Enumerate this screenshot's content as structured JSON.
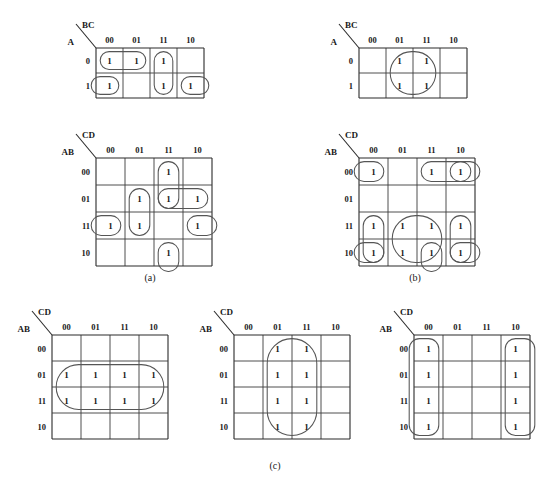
{
  "figure": {
    "captions": {
      "a": "(a)",
      "b": "(b)",
      "c": "(c)"
    },
    "cell_value": "1",
    "col_headers_2": [
      "00",
      "01",
      "11",
      "10"
    ],
    "col_headers_4": [
      "00",
      "01",
      "11",
      "10"
    ],
    "row_headers_2": [
      "0",
      "1"
    ],
    "row_headers_4": [
      "00",
      "01",
      "11",
      "10"
    ],
    "axis_labels": {
      "two_var_col": "BC",
      "two_var_row": "A",
      "four_var_col": "CD",
      "four_var_row": "AB"
    }
  },
  "maps": [
    {
      "id": "a-top",
      "group": "a",
      "vars": 3,
      "col_label": "BC",
      "row_label": "A",
      "col_headers": [
        "00",
        "01",
        "11",
        "10"
      ],
      "row_headers": [
        "0",
        "1"
      ],
      "cells": [
        [
          1,
          1,
          1,
          0
        ],
        [
          1,
          0,
          1,
          1
        ]
      ],
      "loops": [
        {
          "name": "loop-row0-cols00-01",
          "r": 0,
          "c": 0,
          "rows": 1,
          "cols": 2
        },
        {
          "name": "loop-col11-rows0-1",
          "r": 0,
          "c": 2,
          "rows": 2,
          "cols": 1
        },
        {
          "name": "loop-row1-col00",
          "r": 1,
          "c": 0,
          "rows": 1,
          "cols": 1,
          "wrap": "left"
        },
        {
          "name": "loop-row1-col10",
          "r": 1,
          "c": 3,
          "rows": 1,
          "cols": 1,
          "wrap": "right"
        }
      ]
    },
    {
      "id": "a-bottom",
      "group": "a",
      "vars": 4,
      "col_label": "CD",
      "row_label": "AB",
      "col_headers": [
        "00",
        "01",
        "11",
        "10"
      ],
      "row_headers": [
        "00",
        "01",
        "11",
        "10"
      ],
      "cells": [
        [
          0,
          0,
          1,
          0
        ],
        [
          0,
          1,
          1,
          1
        ],
        [
          1,
          1,
          0,
          1
        ],
        [
          0,
          0,
          1,
          0
        ]
      ],
      "loops": [
        {
          "name": "loop-col11-rows00-01",
          "r": 0,
          "c": 2,
          "rows": 2,
          "cols": 1
        },
        {
          "name": "loop-row01-cols11-10",
          "r": 1,
          "c": 2,
          "rows": 1,
          "cols": 2
        },
        {
          "name": "loop-col01-rows01-11",
          "r": 1,
          "c": 1,
          "rows": 2,
          "cols": 1
        },
        {
          "name": "loop-row11-col00",
          "r": 2,
          "c": 0,
          "rows": 1,
          "cols": 1,
          "wrap": "left"
        },
        {
          "name": "loop-row11-col10",
          "r": 2,
          "c": 3,
          "rows": 1,
          "cols": 1,
          "wrap": "right"
        },
        {
          "name": "loop-row10-col11",
          "r": 3,
          "c": 2,
          "rows": 1,
          "cols": 1,
          "wrap": "bottom"
        }
      ]
    },
    {
      "id": "b-top",
      "group": "b",
      "vars": 3,
      "col_label": "BC",
      "row_label": "A",
      "col_headers": [
        "00",
        "01",
        "11",
        "10"
      ],
      "row_headers": [
        "0",
        "1"
      ],
      "cells": [
        [
          0,
          1,
          1,
          0
        ],
        [
          0,
          1,
          1,
          0
        ]
      ],
      "loops": [
        {
          "name": "loop-cols01-11-rows0-1",
          "r": 0,
          "c": 1,
          "rows": 2,
          "cols": 2
        }
      ]
    },
    {
      "id": "b-bottom",
      "group": "b",
      "vars": 4,
      "col_label": "CD",
      "row_label": "AB",
      "col_headers": [
        "00",
        "01",
        "11",
        "10"
      ],
      "row_headers": [
        "00",
        "01",
        "11",
        "10"
      ],
      "cells": [
        [
          1,
          0,
          1,
          1
        ],
        [
          0,
          0,
          0,
          0
        ],
        [
          1,
          1,
          1,
          1
        ],
        [
          1,
          1,
          1,
          1
        ]
      ],
      "loops": [
        {
          "name": "loop-corner-row00-col00",
          "r": 0,
          "c": 0,
          "rows": 1,
          "cols": 1,
          "wrap": "left"
        },
        {
          "name": "loop-row00-cols11-10",
          "r": 0,
          "c": 2,
          "rows": 1,
          "cols": 2
        },
        {
          "name": "loop-corner-row00-col10",
          "r": 0,
          "c": 3,
          "rows": 1,
          "cols": 1,
          "wrap": "right"
        },
        {
          "name": "loop-rows11-10-col00",
          "r": 2,
          "c": 0,
          "rows": 2,
          "cols": 1
        },
        {
          "name": "loop-rows11-10-cols01-11",
          "r": 2,
          "c": 1,
          "rows": 2,
          "cols": 2
        },
        {
          "name": "loop-rows11-10-col10",
          "r": 2,
          "c": 3,
          "rows": 2,
          "cols": 1
        },
        {
          "name": "loop-row10-col00",
          "r": 3,
          "c": 0,
          "rows": 1,
          "cols": 1,
          "wrap": "left"
        },
        {
          "name": "loop-row10-col11",
          "r": 3,
          "c": 2,
          "rows": 1,
          "cols": 1,
          "wrap": "bottom"
        },
        {
          "name": "loop-row10-col10",
          "r": 3,
          "c": 3,
          "rows": 1,
          "cols": 1,
          "wrap": "right"
        }
      ]
    },
    {
      "id": "c-left",
      "group": "c",
      "vars": 4,
      "col_label": "CD",
      "row_label": "AB",
      "col_headers": [
        "00",
        "01",
        "11",
        "10"
      ],
      "row_headers": [
        "00",
        "01",
        "11",
        "10"
      ],
      "cells": [
        [
          0,
          0,
          0,
          0
        ],
        [
          1,
          1,
          1,
          1
        ],
        [
          1,
          1,
          1,
          1
        ],
        [
          0,
          0,
          0,
          0
        ]
      ],
      "loops": [
        {
          "name": "loop-rows01-11-allcols",
          "r": 1,
          "c": 0,
          "rows": 2,
          "cols": 4
        }
      ]
    },
    {
      "id": "c-middle",
      "group": "c",
      "vars": 4,
      "col_label": "CD",
      "row_label": "AB",
      "col_headers": [
        "00",
        "01",
        "11",
        "10"
      ],
      "row_headers": [
        "00",
        "01",
        "11",
        "10"
      ],
      "cells": [
        [
          0,
          1,
          1,
          0
        ],
        [
          0,
          1,
          1,
          0
        ],
        [
          0,
          1,
          1,
          0
        ],
        [
          0,
          1,
          1,
          0
        ]
      ],
      "loops": [
        {
          "name": "loop-cols01-11-allrows",
          "r": 0,
          "c": 1,
          "rows": 4,
          "cols": 2
        }
      ]
    },
    {
      "id": "c-right",
      "group": "c",
      "vars": 4,
      "col_label": "CD",
      "row_label": "AB",
      "col_headers": [
        "00",
        "01",
        "11",
        "10"
      ],
      "row_headers": [
        "00",
        "01",
        "11",
        "10"
      ],
      "cells": [
        [
          1,
          0,
          0,
          1
        ],
        [
          1,
          0,
          0,
          1
        ],
        [
          1,
          0,
          0,
          1
        ],
        [
          1,
          0,
          0,
          1
        ]
      ],
      "loops": [
        {
          "name": "loop-col00-allrows",
          "r": 0,
          "c": 0,
          "rows": 4,
          "cols": 1,
          "wrap": "left"
        },
        {
          "name": "loop-col10-allrows",
          "r": 0,
          "c": 3,
          "rows": 4,
          "cols": 1,
          "wrap": "right"
        }
      ]
    }
  ],
  "layout": [
    {
      "id": "a-top",
      "x": 62,
      "y": 18,
      "cw": 27,
      "ch": 25,
      "cols": 4,
      "rows": 2
    },
    {
      "id": "a-bottom",
      "x": 62,
      "y": 128,
      "cw": 29,
      "ch": 27,
      "cols": 4,
      "rows": 4
    },
    {
      "id": "b-top",
      "x": 325,
      "y": 18,
      "cw": 27,
      "ch": 25,
      "cols": 4,
      "rows": 2
    },
    {
      "id": "b-bottom",
      "x": 325,
      "y": 128,
      "cw": 29,
      "ch": 27,
      "cols": 4,
      "rows": 4
    },
    {
      "id": "c-left",
      "x": 18,
      "y": 305,
      "cw": 29,
      "ch": 26,
      "cols": 4,
      "rows": 4
    },
    {
      "id": "c-middle",
      "x": 200,
      "y": 305,
      "cw": 29,
      "ch": 26,
      "cols": 4,
      "rows": 4
    },
    {
      "id": "c-right",
      "x": 380,
      "y": 305,
      "cw": 29,
      "ch": 26,
      "cols": 4,
      "rows": 4
    }
  ],
  "caption_positions": [
    {
      "key": "a",
      "x": 120,
      "y": 272,
      "w": 60
    },
    {
      "key": "b",
      "x": 385,
      "y": 272,
      "w": 60
    },
    {
      "key": "c",
      "x": 245,
      "y": 460,
      "w": 60
    }
  ]
}
